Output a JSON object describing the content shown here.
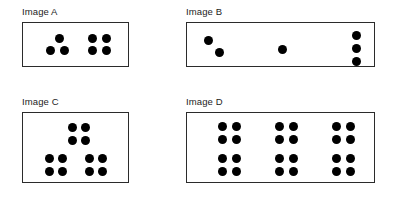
{
  "page": {
    "background_color": "#ffffff",
    "dot_color": "#000000",
    "border_color": "#2b2b2b",
    "dot_diameter": 9
  },
  "panels": [
    {
      "id": "a",
      "label": "Image A",
      "total_dots": 7,
      "groups": [
        {
          "name": "triangle-group-3",
          "count": 3,
          "dots": [
            [
              32,
              11
            ],
            [
              23,
              23
            ],
            [
              37,
              23
            ]
          ]
        },
        {
          "name": "square-group-4",
          "count": 4,
          "dots": [
            [
              65,
              11
            ],
            [
              79,
              11
            ],
            [
              65,
              23
            ],
            [
              79,
              23
            ]
          ]
        }
      ]
    },
    {
      "id": "b",
      "label": "Image B",
      "total_dots": 6,
      "groups": [
        {
          "name": "diagonal-pair-2",
          "count": 2,
          "dots": [
            [
              17,
              13
            ],
            [
              28,
              25
            ]
          ]
        },
        {
          "name": "single-dot-1",
          "count": 1,
          "dots": [
            [
              91,
              22
            ]
          ]
        },
        {
          "name": "vertical-triple-3",
          "count": 3,
          "dots": [
            [
              165,
              8
            ],
            [
              165,
              21
            ],
            [
              165,
              34
            ]
          ]
        }
      ]
    },
    {
      "id": "c",
      "label": "Image C",
      "total_dots": 12,
      "groups": [
        {
          "name": "top-square-4",
          "count": 4,
          "dots": [
            [
              45,
              10
            ],
            [
              58,
              10
            ],
            [
              45,
              23
            ],
            [
              58,
              23
            ]
          ]
        },
        {
          "name": "bottom-left-square-4",
          "count": 4,
          "dots": [
            [
              22,
              41
            ],
            [
              35,
              41
            ],
            [
              22,
              54
            ],
            [
              35,
              54
            ]
          ]
        },
        {
          "name": "bottom-right-square-4",
          "count": 4,
          "dots": [
            [
              62,
              41
            ],
            [
              75,
              41
            ],
            [
              62,
              54
            ],
            [
              75,
              54
            ]
          ]
        }
      ]
    },
    {
      "id": "d",
      "label": "Image D",
      "total_dots": 24,
      "groups": [
        {
          "name": "square-r1c1-4",
          "count": 4,
          "dots": [
            [
              31,
              9
            ],
            [
              45,
              9
            ],
            [
              31,
              22
            ],
            [
              45,
              22
            ]
          ]
        },
        {
          "name": "square-r1c2-4",
          "count": 4,
          "dots": [
            [
              88,
              9
            ],
            [
              102,
              9
            ],
            [
              88,
              22
            ],
            [
              102,
              22
            ]
          ]
        },
        {
          "name": "square-r1c3-4",
          "count": 4,
          "dots": [
            [
              145,
              9
            ],
            [
              159,
              9
            ],
            [
              145,
              22
            ],
            [
              159,
              22
            ]
          ]
        },
        {
          "name": "square-r2c1-4",
          "count": 4,
          "dots": [
            [
              31,
              41
            ],
            [
              45,
              41
            ],
            [
              31,
              54
            ],
            [
              45,
              54
            ]
          ]
        },
        {
          "name": "square-r2c2-4",
          "count": 4,
          "dots": [
            [
              88,
              41
            ],
            [
              102,
              41
            ],
            [
              88,
              54
            ],
            [
              102,
              54
            ]
          ]
        },
        {
          "name": "square-r2c3-4",
          "count": 4,
          "dots": [
            [
              145,
              41
            ],
            [
              159,
              41
            ],
            [
              145,
              54
            ],
            [
              159,
              54
            ]
          ]
        }
      ]
    }
  ]
}
